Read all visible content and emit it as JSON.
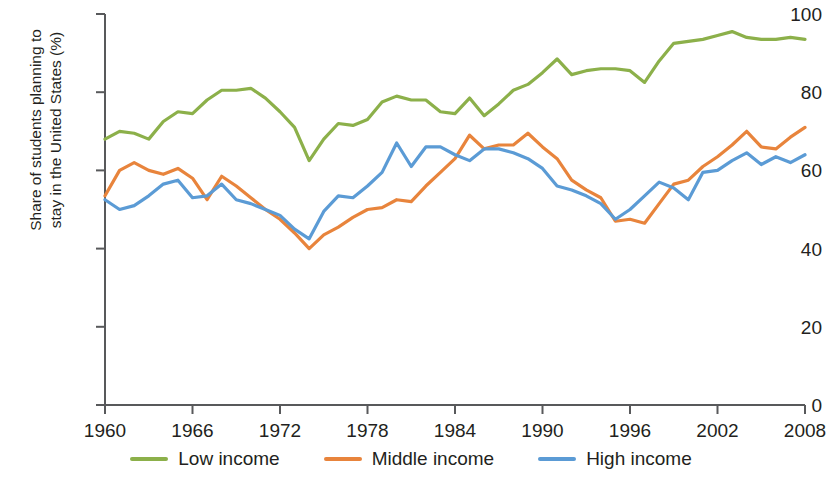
{
  "chart_data": {
    "type": "line",
    "title": "",
    "xlabel": "",
    "ylabel": "Share of students planning to stay in the United States (%)",
    "ylabel_line1": "Share of students planning to",
    "ylabel_line2": "stay in the United States (%)",
    "xlim": [
      1960,
      2008
    ],
    "ylim": [
      0,
      100
    ],
    "grid": false,
    "legend_position": "bottom",
    "y_ticks": [
      0,
      20,
      40,
      60,
      80,
      100
    ],
    "y_tick_labels": [
      "0",
      "20",
      "40",
      "60",
      "80",
      "100"
    ],
    "x_ticks": [
      1960,
      1966,
      1972,
      1978,
      1984,
      1990,
      1996,
      2002,
      2008
    ],
    "x_tick_labels": [
      "1960",
      "1966",
      "1972",
      "1978",
      "1984",
      "1990",
      "1996",
      "2002",
      "2008"
    ],
    "x": [
      1960,
      1961,
      1962,
      1963,
      1964,
      1965,
      1966,
      1967,
      1968,
      1969,
      1970,
      1971,
      1972,
      1973,
      1974,
      1975,
      1976,
      1977,
      1978,
      1979,
      1980,
      1981,
      1982,
      1983,
      1984,
      1985,
      1986,
      1987,
      1988,
      1989,
      1990,
      1991,
      1992,
      1993,
      1994,
      1995,
      1996,
      1997,
      1998,
      1999,
      2000,
      2001,
      2002,
      2003,
      2004,
      2005,
      2006,
      2007,
      2008
    ],
    "series": [
      {
        "name": "Low income",
        "color": "#8cb04a",
        "values": [
          68.0,
          70.0,
          69.5,
          68.0,
          72.5,
          75.0,
          74.5,
          78.0,
          80.5,
          80.5,
          81.0,
          78.5,
          75.0,
          71.0,
          62.5,
          68.0,
          72.0,
          71.5,
          73.0,
          77.5,
          79.0,
          78.0,
          78.0,
          75.0,
          74.5,
          78.5,
          74.0,
          77.0,
          80.5,
          82.0,
          85.0,
          88.5,
          84.5,
          85.5,
          86.0,
          86.0,
          85.5,
          82.5,
          88.0,
          92.5,
          93.0,
          93.5,
          94.5,
          95.5,
          94.0,
          93.5,
          93.5,
          94.0,
          93.5
        ]
      },
      {
        "name": "Middle income",
        "color": "#e8843c",
        "values": [
          53.5,
          60.0,
          62.0,
          60.0,
          59.0,
          60.5,
          58.0,
          52.5,
          58.5,
          56.0,
          53.0,
          50.0,
          47.5,
          44.0,
          40.0,
          43.5,
          45.5,
          48.0,
          50.0,
          50.5,
          52.5,
          52.0,
          56.0,
          59.5,
          63.0,
          69.0,
          65.5,
          66.5,
          66.5,
          69.5,
          66.0,
          63.0,
          57.5,
          55.0,
          53.0,
          47.0,
          47.5,
          46.5,
          51.5,
          56.5,
          57.5,
          61.0,
          63.5,
          66.5,
          70.0,
          66.0,
          65.5,
          68.5,
          71.0
        ]
      },
      {
        "name": "High income",
        "color": "#5b9bd5",
        "values": [
          52.5,
          50.0,
          51.0,
          53.5,
          56.5,
          57.5,
          53.0,
          53.5,
          56.5,
          52.5,
          51.5,
          50.0,
          48.5,
          45.0,
          42.5,
          49.5,
          53.5,
          53.0,
          56.0,
          59.5,
          67.0,
          61.0,
          66.0,
          66.0,
          64.0,
          62.5,
          65.5,
          65.5,
          64.5,
          63.0,
          60.5,
          56.0,
          55.0,
          53.5,
          51.5,
          47.5,
          50.0,
          53.5,
          57.0,
          55.5,
          52.5,
          59.5,
          60.0,
          62.5,
          64.5,
          61.5,
          63.5,
          62.0,
          64.0
        ]
      }
    ],
    "legend": [
      {
        "label": "Low income",
        "color": "#8cb04a"
      },
      {
        "label": "Middle income",
        "color": "#e8843c"
      },
      {
        "label": "High income",
        "color": "#5b9bd5"
      }
    ]
  }
}
